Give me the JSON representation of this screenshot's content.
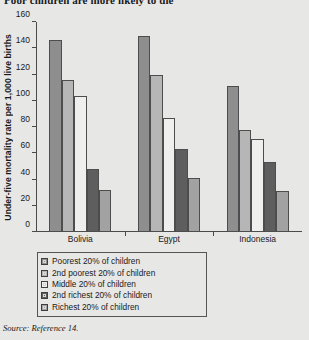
{
  "headline": "Poor children are more likely to die",
  "source_note": "Source: Reference 14.",
  "chart_data": {
    "type": "bar",
    "title": "Poor children are more likely to die",
    "xlabel": "",
    "ylabel": "Under-five mortality rate per 1,000 live births",
    "ylim": [
      0,
      160
    ],
    "yticks": [
      0,
      20,
      40,
      60,
      80,
      100,
      120,
      140,
      160
    ],
    "grid": false,
    "legend_position": "below-plot",
    "categories": [
      "Bolivia",
      "Egypt",
      "Indonesia"
    ],
    "series": [
      {
        "name": "Poorest 20% of children",
        "color": "#8e8e8e",
        "values": [
          146,
          149,
          111
        ]
      },
      {
        "name": "2nd poorest 20% of children",
        "color": "#b6b6b6",
        "values": [
          116,
          120,
          78
        ]
      },
      {
        "name": "Middle 20% of children",
        "color": "#efefed",
        "values": [
          104,
          87,
          71
        ]
      },
      {
        "name": "2nd richest 20% of children",
        "color": "#5e5e5e",
        "values": [
          48,
          63,
          53
        ]
      },
      {
        "name": "Richest 20% of children",
        "color": "#a2a2a2",
        "values": [
          32,
          41,
          31
        ]
      }
    ]
  }
}
